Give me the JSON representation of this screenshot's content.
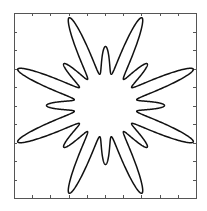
{
  "chart_data": {
    "type": "line",
    "subtype": "polar-curve",
    "title": "",
    "xlabel": "",
    "ylabel": "",
    "xtick_labels": [],
    "ytick_labels": [],
    "grid": false,
    "legend": null,
    "axes_box": {
      "left": 14,
      "top": 13,
      "right": 196,
      "bottom": 198
    },
    "tick_intervals": 10,
    "tick_length": 3,
    "center": [
      105.5,
      105.5
    ],
    "curve": {
      "description": "16-petal flower: 8 long petals at 22.5 deg + k*45 deg, 8 short petals at k*45 deg",
      "base_radius": 28,
      "long_petals": {
        "count": 8,
        "offset_deg": 22.5,
        "length": 67,
        "sigma": 0.11
      },
      "short_petals": {
        "count": 8,
        "offset_deg": 0,
        "length": 31,
        "sigma": 0.11
      },
      "long_petal_tips": [
        [
          191,
          68
        ],
        [
          140,
          17
        ],
        [
          71,
          17
        ],
        [
          20,
          68
        ],
        [
          20,
          144
        ],
        [
          69,
          194
        ],
        [
          141,
          194
        ],
        [
          191,
          144
        ]
      ],
      "short_petal_tips": [
        [
          164,
          106
        ],
        [
          146,
          64
        ],
        [
          105,
          46
        ],
        [
          65,
          64
        ],
        [
          47,
          106
        ],
        [
          65,
          147
        ],
        [
          105,
          165
        ],
        [
          146,
          147
        ]
      ]
    },
    "colors": {
      "curve": "#111111",
      "axes": "#555555",
      "background": "#ffffff"
    }
  }
}
